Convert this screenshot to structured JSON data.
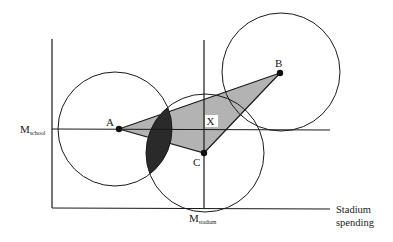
{
  "diagram": {
    "axis_labels": {
      "x_line1": "Stadium",
      "x_line2": "spending",
      "m_school_main": "M",
      "m_school_sub": "school",
      "m_stadium_main": "M",
      "m_stadium_sub": "stadium"
    },
    "points": {
      "a": "A",
      "b": "B",
      "c": "C",
      "x": "X"
    },
    "colors": {
      "triangle_fill": "#b3b3b3",
      "lens_fill": "#2a2a2a",
      "line": "#1a1a1a"
    }
  }
}
